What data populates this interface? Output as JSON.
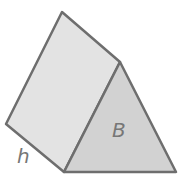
{
  "diagram": {
    "colors": {
      "stroke": "#6e6e6e",
      "side_face": "#e3e3e3",
      "base_face": "#d2d2d2",
      "label": "#777777"
    },
    "labels": {
      "height": "h",
      "base": "B"
    }
  }
}
